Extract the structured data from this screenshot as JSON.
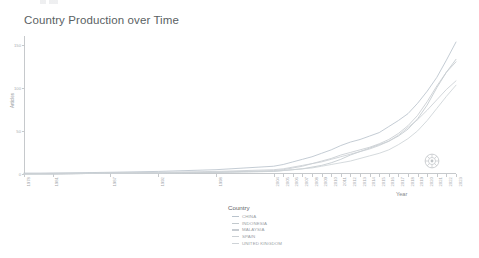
{
  "chart_data": {
    "type": "line",
    "title": "Country Production over Time",
    "xlabel": "Year",
    "ylabel": "Articles",
    "grid": false,
    "legend_position": "bottom-center",
    "legend_title": "Country",
    "xlim": [
      1978,
      2023
    ],
    "ylim": [
      0,
      160
    ],
    "y_ticks": [
      "0",
      "50",
      "100",
      "150"
    ],
    "y_tick_values": [
      0,
      50,
      100,
      150
    ],
    "x_tick_labels": [
      "1978",
      "1981",
      "1987",
      "1992",
      "1998",
      "2004",
      "2005",
      "2006",
      "2007",
      "2008",
      "2009",
      "2010",
      "2011",
      "2012",
      "2013",
      "2014",
      "2015",
      "2016",
      "2017",
      "2018",
      "2019",
      "2020",
      "2021",
      "2022",
      "2023"
    ],
    "x_tick_values": [
      1978,
      1981,
      1987,
      1992,
      1998,
      2004,
      2005,
      2006,
      2007,
      2008,
      2009,
      2010,
      2011,
      2012,
      2013,
      2014,
      2015,
      2016,
      2017,
      2018,
      2019,
      2020,
      2021,
      2022,
      2023
    ],
    "x": [
      1978,
      1981,
      1987,
      1992,
      1998,
      2004,
      2005,
      2006,
      2007,
      2008,
      2009,
      2010,
      2011,
      2012,
      2013,
      2014,
      2015,
      2016,
      2017,
      2018,
      2019,
      2020,
      2021,
      2022,
      2023
    ],
    "series": [
      {
        "name": "CHINA",
        "color": "#b9c3cc",
        "values": [
          1,
          1,
          2,
          3,
          5,
          9,
          11,
          14,
          17,
          20,
          24,
          28,
          33,
          37,
          40,
          44,
          48,
          55,
          62,
          70,
          82,
          96,
          112,
          132,
          153
        ]
      },
      {
        "name": "INDONESIA",
        "color": "#c2c9cd",
        "values": [
          0,
          0,
          1,
          1,
          2,
          3,
          4,
          5,
          6,
          8,
          10,
          13,
          17,
          22,
          26,
          30,
          34,
          38,
          44,
          52,
          64,
          80,
          100,
          118,
          133
        ]
      },
      {
        "name": "MALAYSIA",
        "color": "#c7ccd1",
        "values": [
          0,
          0,
          1,
          1,
          2,
          4,
          5,
          7,
          9,
          12,
          15,
          18,
          22,
          25,
          28,
          31,
          35,
          40,
          47,
          56,
          68,
          84,
          102,
          118,
          130
        ]
      },
      {
        "name": "SPAIN",
        "color": "#cbd0d4",
        "values": [
          0,
          1,
          1,
          2,
          3,
          5,
          6,
          8,
          10,
          12,
          14,
          17,
          20,
          23,
          26,
          29,
          33,
          38,
          45,
          54,
          63,
          74,
          86,
          98,
          108
        ]
      },
      {
        "name": "UNITED KINGDOM",
        "color": "#ced3d7",
        "values": [
          0,
          0,
          1,
          1,
          2,
          3,
          4,
          5,
          6,
          7,
          9,
          11,
          13,
          15,
          18,
          21,
          24,
          28,
          34,
          41,
          50,
          62,
          76,
          90,
          103
        ]
      }
    ]
  },
  "chart": {
    "title": "Country Production over Time",
    "x_axis_title": "Year",
    "y_axis_title": "Articles"
  },
  "legend": {
    "title": "Country",
    "items": [
      {
        "label": "CHINA"
      },
      {
        "label": "INDONESIA"
      },
      {
        "label": "MALAYSIA"
      },
      {
        "label": "SPAIN"
      },
      {
        "label": "UNITED KINGDOM"
      }
    ]
  },
  "watermark": {
    "name": "circular-logo-watermark"
  }
}
